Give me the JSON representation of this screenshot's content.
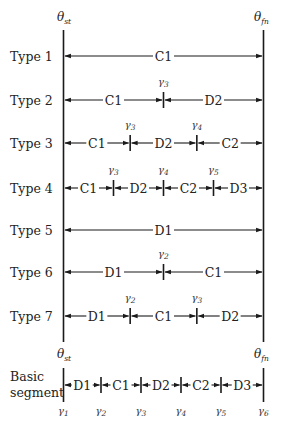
{
  "diagram": {
    "boundaries": {
      "start": {
        "symbol": "θ",
        "sub": "st"
      },
      "end": {
        "symbol": "θ",
        "sub": "fn"
      }
    },
    "rows": [
      {
        "label": "Type 1",
        "segments": [
          "C1"
        ],
        "gammas": []
      },
      {
        "label": "Type 2",
        "segments": [
          "C1",
          "D2"
        ],
        "gammas": [
          {
            "sym": "γ",
            "sub": "3"
          }
        ]
      },
      {
        "label": "Type 3",
        "segments": [
          "C1",
          "D2",
          "C2"
        ],
        "gammas": [
          {
            "sym": "γ",
            "sub": "3"
          },
          {
            "sym": "γ",
            "sub": "4"
          }
        ]
      },
      {
        "label": "Type 4",
        "segments": [
          "C1",
          "D2",
          "C2",
          "D3"
        ],
        "gammas": [
          {
            "sym": "γ",
            "sub": "3"
          },
          {
            "sym": "γ",
            "sub": "4"
          },
          {
            "sym": "γ",
            "sub": "5"
          }
        ]
      },
      {
        "label": "Type 5",
        "segments": [
          "D1"
        ],
        "gammas": []
      },
      {
        "label": "Type 6",
        "segments": [
          "D1",
          "C1"
        ],
        "gammas": [
          {
            "sym": "γ",
            "sub": "2"
          }
        ]
      },
      {
        "label": "Type 7",
        "segments": [
          "D1",
          "C1",
          "D2"
        ],
        "gammas": [
          {
            "sym": "γ",
            "sub": "2"
          },
          {
            "sym": "γ",
            "sub": "3"
          }
        ]
      }
    ],
    "basic_segment": {
      "label_line1": "Basic",
      "label_line2": "segment",
      "segments": [
        "D1",
        "C1",
        "D2",
        "C2",
        "D3"
      ],
      "gammas": [
        {
          "sym": "γ",
          "sub": "1"
        },
        {
          "sym": "γ",
          "sub": "2"
        },
        {
          "sym": "γ",
          "sub": "3"
        },
        {
          "sym": "γ",
          "sub": "4"
        },
        {
          "sym": "γ",
          "sub": "5"
        },
        {
          "sym": "γ",
          "sub": "6"
        }
      ]
    }
  }
}
